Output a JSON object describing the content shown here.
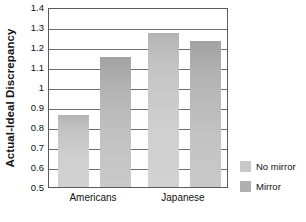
{
  "chart_data": {
    "type": "bar",
    "title": "",
    "xlabel": "",
    "ylabel": "Actual-Ideal Discrepancy",
    "categories": [
      "Americans",
      "Japanese"
    ],
    "series": [
      {
        "name": "No mirror",
        "values": [
          0.86,
          1.27
        ],
        "color": "#c8c8c8"
      },
      {
        "name": "Mirror",
        "values": [
          1.15,
          1.23
        ],
        "color": "#b0b0b0"
      }
    ],
    "ylim": [
      0.5,
      1.4
    ],
    "ytick_values": [
      1.4,
      1.3,
      1.2,
      1.1,
      1.0,
      0.9,
      0.8,
      0.7,
      0.6,
      0.5
    ],
    "ytick_labels": [
      "1.4",
      "1.3",
      "1.2",
      "1.1",
      "1",
      "0.9",
      "0.8",
      "0.7",
      "0.6",
      "0.5"
    ],
    "grid": true,
    "grid_axis": "y",
    "legend_position": "right"
  },
  "legend": {
    "entries": [
      {
        "label": "No mirror",
        "color": "#c8c8c8"
      },
      {
        "label": "Mirror",
        "color": "#b0b0b0"
      }
    ]
  },
  "colors": {
    "axis": "#5b5b5b",
    "grid": "#6e6e6e",
    "text": "#111111",
    "background": "#ffffff"
  }
}
